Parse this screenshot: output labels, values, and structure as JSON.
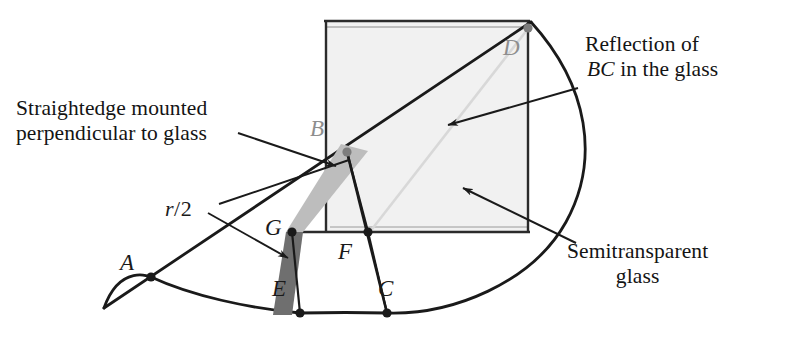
{
  "figure": {
    "background": "#ffffff"
  },
  "captions": {
    "straightedge": {
      "line1": "Straightedge mounted",
      "line2": "perpendicular to glass"
    },
    "reflection": {
      "line1": "Reflection of",
      "math": "BC",
      "line2_rest": " in the glass"
    },
    "semitransparent": {
      "line1": "Semitransparent",
      "line2": "glass"
    }
  },
  "measure_label": {
    "variable": "r",
    "slash": "/",
    "number": "2"
  },
  "points": [
    {
      "id": "A",
      "label": "A",
      "x": 151,
      "y": 277,
      "dot": "black"
    },
    {
      "id": "B",
      "label": "B",
      "x": 347,
      "y": 152,
      "dot": "gray"
    },
    {
      "id": "C",
      "label": "C",
      "x": 387,
      "y": 313,
      "dot": "black"
    },
    {
      "id": "D",
      "label": "D",
      "x": 528,
      "y": 28,
      "dot": "gray"
    },
    {
      "id": "E",
      "label": "E",
      "x": 300,
      "y": 313,
      "dot": "black"
    },
    {
      "id": "F",
      "label": "F",
      "x": 368,
      "y": 232,
      "dot": "black"
    },
    {
      "id": "G",
      "label": "G",
      "x": 292,
      "y": 232,
      "dot": "black"
    }
  ],
  "colors": {
    "ink": "#1a1a1a",
    "gray_point": "#8e8e8e",
    "glass_fill": "#f1f1f1",
    "glass_edge": "#2b2b2b",
    "straightedge_light": "#b9b9b9",
    "straightedge_dark": "#6e6e6e",
    "reflection_line": "#d6d6d6"
  },
  "geometry": {
    "glass_rect": {
      "left": 326,
      "top": 22,
      "right": 528,
      "bottom": 232
    },
    "arc_center_approx": {
      "x": 151,
      "y": 277
    },
    "arc_radius_approx": 378,
    "lines": [
      {
        "name": "ray-A-B-D",
        "from": "A",
        "to": "D"
      },
      {
        "name": "segment-B-F",
        "from": "B",
        "to": "F"
      },
      {
        "name": "segment-B-C",
        "from": "B",
        "to": "C"
      },
      {
        "name": "segment-A-E",
        "from": "A",
        "to": "E"
      },
      {
        "name": "reflection-D-F",
        "from": "D",
        "to": "F"
      }
    ]
  }
}
